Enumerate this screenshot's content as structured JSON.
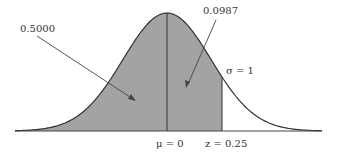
{
  "diagram": {
    "type": "normal-distribution",
    "labels": {
      "left_area": "0.5000",
      "right_area": "0.0987",
      "sigma": "σ = 1",
      "mu": "μ = 0",
      "z": "z = 0.25"
    },
    "colors": {
      "shade": "#a3a3a3",
      "curve": "#333333",
      "background": "#ffffff"
    },
    "mean": 0,
    "sd": 1,
    "z_value": 0.25,
    "area_left_of_mean": 0.5,
    "area_mean_to_z": 0.0987
  }
}
